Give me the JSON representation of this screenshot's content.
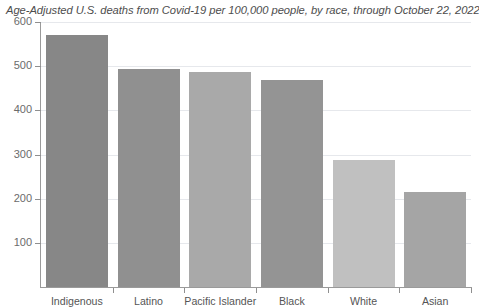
{
  "chart_data": {
    "type": "bar",
    "title": "Age-Adjusted U.S. deaths from Covid-19 per 100,000 people, by race, through October 22, 2022",
    "xlabel": "",
    "ylabel": "",
    "categories": [
      "Indigenous",
      "Latino",
      "Pacific Islander",
      "Black",
      "White",
      "Asian"
    ],
    "values": [
      570,
      493,
      487,
      468,
      288,
      215
    ],
    "series": [
      {
        "name": "Age-Adjusted deaths per 100,000",
        "values": [
          570,
          493,
          487,
          468,
          288,
          215
        ]
      }
    ],
    "ylim": [
      0,
      600
    ],
    "yticks": [
      100,
      200,
      300,
      400,
      500,
      600
    ],
    "ytick_labels": [
      "100",
      "200",
      "300",
      "400",
      "500",
      "600"
    ],
    "grid": true,
    "grid_axis": "y",
    "legend": false,
    "bar_colors": [
      "#878787",
      "#909090",
      "#a9a9a9",
      "#949494",
      "#c0c0c0",
      "#a5a5a5"
    ]
  },
  "axis": {
    "y_labels": [
      "600",
      "500",
      "400",
      "300",
      "200",
      "100"
    ],
    "x_labels": [
      "Indigenous",
      "Latino",
      "Pacific Islander",
      "Black",
      "White",
      "Asian"
    ]
  },
  "colors": {
    "background": "#ffffff",
    "axis": "#9a9a9a",
    "gridline": "#e6e8ec",
    "title_text": "#4d4d4d",
    "tick_text": "#6b6b6b"
  }
}
